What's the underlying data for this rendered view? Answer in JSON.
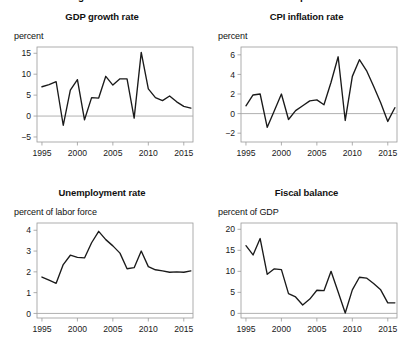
{
  "figure": {
    "cut_off_header_left": "g",
    "cut_off_header_right": "p"
  },
  "panels": [
    {
      "id": "gdp-growth-rate",
      "title": "GDP growth rate",
      "subtitle": "percent"
    },
    {
      "id": "cpi-inflation-rate",
      "title": "CPI inflation rate",
      "subtitle": "percent"
    },
    {
      "id": "unemployment-rate",
      "title": "Unemployment rate",
      "subtitle": "percent of labor force"
    },
    {
      "id": "fiscal-balance",
      "title": "Fiscal balance",
      "subtitle": "percent of GDP"
    }
  ],
  "chart_data": [
    {
      "type": "line",
      "title": "GDP growth rate",
      "ylabel": "percent",
      "xlabel": "",
      "xlim": [
        1994.3,
        2016.3
      ],
      "ylim": [
        -6.2,
        16.5
      ],
      "yticks": [
        -5,
        0,
        5,
        10,
        15
      ],
      "ytick_labels": [
        "−5",
        "0",
        "5",
        "10",
        "15"
      ],
      "xticks": [
        1995,
        2000,
        2005,
        2010,
        2015
      ],
      "xtick_labels": [
        "1995",
        "2000",
        "2005",
        "2010",
        "2015"
      ],
      "zero_line": 0,
      "grid": false,
      "legend": "none",
      "x": [
        1995,
        1996,
        1997,
        1998,
        1999,
        2000,
        2001,
        2002,
        2003,
        2004,
        2005,
        2006,
        2007,
        2008,
        2009,
        2010,
        2011,
        2012,
        2013,
        2014,
        2015,
        2016
      ],
      "values": [
        7.0,
        7.5,
        8.2,
        -2.2,
        6.2,
        8.7,
        -0.9,
        4.4,
        4.3,
        9.5,
        7.4,
        8.9,
        8.9,
        -0.5,
        15.2,
        6.5,
        4.4,
        3.7,
        4.8,
        3.4,
        2.3,
        1.9
      ]
    },
    {
      "type": "line",
      "title": "CPI inflation rate",
      "ylabel": "percent",
      "xlabel": "",
      "xlim": [
        1994.3,
        2016.3
      ],
      "ylim": [
        -2.9,
        6.8
      ],
      "yticks": [
        -2,
        0,
        2,
        4,
        6
      ],
      "ytick_labels": [
        "−2",
        "0",
        "2",
        "4",
        "6"
      ],
      "xticks": [
        1995,
        2000,
        2005,
        2010,
        2015
      ],
      "xtick_labels": [
        "1995",
        "2000",
        "2005",
        "2010",
        "2015"
      ],
      "zero_line": 0,
      "grid": false,
      "legend": "none",
      "x": [
        1995,
        1996,
        1997,
        1998,
        1999,
        2000,
        2001,
        2002,
        2003,
        2004,
        2005,
        2006,
        2007,
        2008,
        2009,
        2010,
        2011,
        2012,
        2013,
        2014,
        2015,
        2016
      ],
      "values": [
        0.8,
        1.9,
        2.0,
        -1.4,
        0.3,
        2.0,
        -0.6,
        0.3,
        0.8,
        1.3,
        1.4,
        0.9,
        3.2,
        5.8,
        -0.7,
        3.8,
        5.5,
        4.4,
        2.8,
        1.1,
        -0.8,
        0.6
      ]
    },
    {
      "type": "line",
      "title": "Unemployment rate",
      "ylabel": "percent of labor force",
      "xlabel": "",
      "xlim": [
        1994.3,
        2016.3
      ],
      "ylim": [
        -0.22,
        4.35
      ],
      "yticks": [
        0,
        1,
        2,
        3,
        4
      ],
      "ytick_labels": [
        "0",
        "1",
        "2",
        "3",
        "4"
      ],
      "xticks": [
        1995,
        2000,
        2005,
        2010,
        2015
      ],
      "xtick_labels": [
        "1995",
        "2000",
        "2005",
        "2010",
        "2015"
      ],
      "zero_line": 0,
      "grid": false,
      "legend": "none",
      "x": [
        1995,
        1996,
        1997,
        1998,
        1999,
        2000,
        2001,
        2002,
        2003,
        2004,
        2005,
        2006,
        2007,
        2008,
        2009,
        2010,
        2011,
        2012,
        2013,
        2014,
        2015,
        2016
      ],
      "values": [
        1.75,
        1.6,
        1.45,
        2.35,
        2.8,
        2.7,
        2.67,
        3.4,
        3.95,
        3.55,
        3.25,
        2.9,
        2.15,
        2.2,
        3.0,
        2.25,
        2.1,
        2.05,
        1.98,
        2.0,
        1.98,
        2.05
      ]
    },
    {
      "type": "line",
      "title": "Fiscal balance",
      "ylabel": "percent of GDP",
      "xlabel": "",
      "xlim": [
        1994.3,
        2016.3
      ],
      "ylim": [
        -1.1,
        21.5
      ],
      "yticks": [
        0,
        5,
        10,
        15,
        20
      ],
      "ytick_labels": [
        "0",
        "5",
        "10",
        "15",
        "20"
      ],
      "xticks": [
        1995,
        2000,
        2005,
        2010,
        2015
      ],
      "xtick_labels": [
        "1995",
        "2000",
        "2005",
        "2010",
        "2015"
      ],
      "zero_line": 0,
      "grid": false,
      "legend": "none",
      "x": [
        1995,
        1996,
        1997,
        1998,
        1999,
        2000,
        2001,
        2002,
        2003,
        2004,
        2005,
        2006,
        2007,
        2008,
        2009,
        2010,
        2011,
        2012,
        2013,
        2014,
        2015,
        2016
      ],
      "values": [
        16.1,
        13.9,
        17.8,
        9.3,
        10.6,
        10.4,
        4.7,
        3.9,
        2.0,
        3.4,
        5.5,
        5.4,
        10.0,
        5.1,
        0.1,
        5.6,
        8.6,
        8.4,
        7.1,
        5.6,
        2.5,
        2.5
      ]
    }
  ]
}
